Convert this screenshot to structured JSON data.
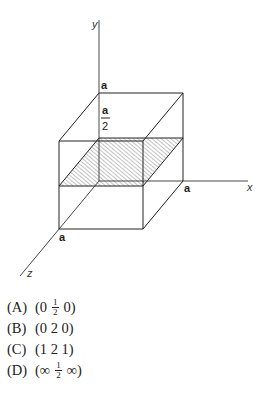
{
  "figure": {
    "axes": {
      "x_label": "x",
      "y_label": "y",
      "z_label": "z"
    },
    "cube_labels": {
      "y_intercept_top": "a",
      "half_num": "a",
      "half_den": "2",
      "x_intercept": "a",
      "z_intercept": "a"
    },
    "plane": {
      "description": "hatched plane parallel to xz-plane at y = a/2",
      "fill": "hatched"
    },
    "colors": {
      "line": "#222222",
      "hatch": "#555555",
      "background": "#ffffff"
    }
  },
  "choices": [
    {
      "letter": "(A)",
      "parts": [
        "(0",
        "1/2",
        "0)"
      ]
    },
    {
      "letter": "(B)",
      "text": "(0 2 0)"
    },
    {
      "letter": "(C)",
      "text": "(1 2 1)"
    },
    {
      "letter": "(D)",
      "parts": [
        "(∞",
        "1/2",
        "∞)"
      ]
    }
  ],
  "fractions": {
    "one": "1",
    "two": "2"
  }
}
